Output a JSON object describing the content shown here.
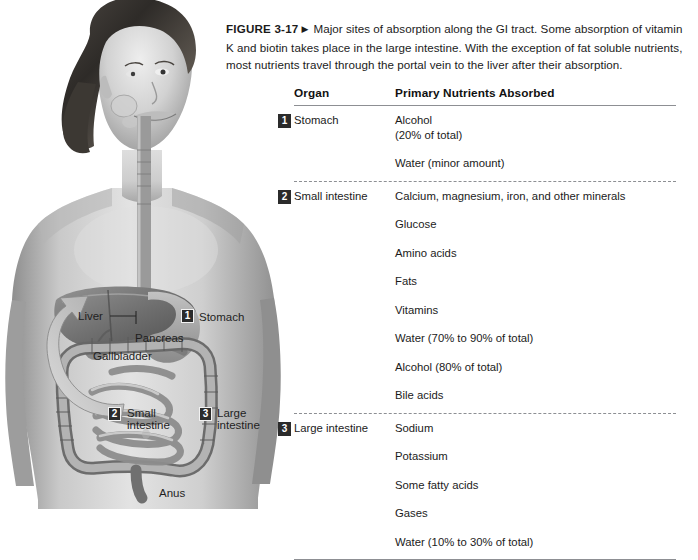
{
  "caption": {
    "figure_label": "FIGURE 3-17",
    "marker": "right-triangle",
    "text": "Major sites of absorption along the GI tract. Some absorption of vitamin K and biotin takes place in the large intestine. With the exception of fat soluble nutrients, most nutrients travel through the portal vein to the liver after their absorption."
  },
  "illustration": {
    "alt": "Grayscale anatomical illustration of a woman showing the gastrointestinal tract",
    "labels": [
      {
        "id": "liver",
        "text": "Liver"
      },
      {
        "id": "pancreas",
        "text": "Pancreas"
      },
      {
        "id": "gallbladder",
        "text": "Gallbladder"
      },
      {
        "id": "stomach",
        "text": "Stomach",
        "badge": "1"
      },
      {
        "id": "small-intestine",
        "text": "Small\nintestine",
        "badge": "2"
      },
      {
        "id": "large-intestine",
        "text": "Large\nintestine",
        "badge": "3"
      },
      {
        "id": "anus",
        "text": "Anus"
      }
    ],
    "small_intestine_line1": "Small",
    "small_intestine_line2": "intestine",
    "large_intestine_line1": "Large",
    "large_intestine_line2": "intestine"
  },
  "table": {
    "headers": {
      "organ": "Organ",
      "nutrients": "Primary Nutrients Absorbed"
    },
    "rows": [
      {
        "badge": "1",
        "organ": "Stomach",
        "nutrients": [
          {
            "main": "Alcohol",
            "sub": "(20% of total)"
          },
          {
            "main": "Water (minor amount)"
          }
        ]
      },
      {
        "badge": "2",
        "organ": "Small intestine",
        "nutrients": [
          {
            "main": "Calcium, magnesium, iron, and other minerals"
          },
          {
            "main": "Glucose"
          },
          {
            "main": "Amino acids"
          },
          {
            "main": "Fats"
          },
          {
            "main": "Vitamins"
          },
          {
            "main": "Water (70% to 90% of total)"
          },
          {
            "main": "Alcohol (80% of total)"
          },
          {
            "main": "Bile acids"
          }
        ]
      },
      {
        "badge": "3",
        "organ": "Large intestine",
        "nutrients": [
          {
            "main": "Sodium"
          },
          {
            "main": "Potassium"
          },
          {
            "main": "Some fatty acids"
          },
          {
            "main": "Gases"
          },
          {
            "main": "Water (10% to 30% of total)"
          }
        ]
      }
    ]
  },
  "colors": {
    "badge_bg": "#2b2b2b",
    "badge_fg": "#ffffff",
    "rule": "#8d8f93",
    "text": "#1b1b1b",
    "page_bg": "#ffffff"
  }
}
